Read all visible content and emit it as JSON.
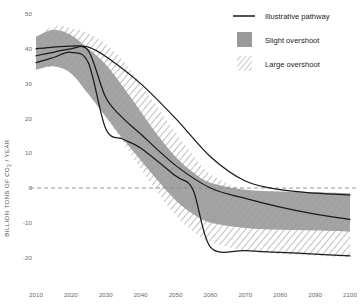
{
  "chart_data": {
    "type": "area",
    "title": "",
    "subtitle": "",
    "xlabel": "",
    "ylabel": "BILLION TONS OF CO₂ / YEAR",
    "ylabel_parts": {
      "pre": "BILLION TONS OF CO",
      "sub": "2",
      "post": " / YEAR"
    },
    "x": [
      2010,
      2020,
      2030,
      2040,
      2050,
      2060,
      2070,
      2080,
      2090,
      2100
    ],
    "xlim": [
      2010,
      2100
    ],
    "ylim": [
      -25,
      52
    ],
    "yticks": [
      50,
      40,
      30,
      20,
      10,
      0,
      -10,
      -20
    ],
    "ytick_labels": [
      "50",
      "40",
      "30",
      "20",
      "10",
      "0",
      "-10",
      "-20"
    ],
    "xticks": [
      2010,
      2020,
      2030,
      2040,
      2050,
      2060,
      2070,
      2080,
      2090,
      2100
    ],
    "xtick_labels": [
      "2010",
      "2020",
      "2030",
      "2040",
      "2050",
      "2060",
      "2070",
      "2080",
      "2090",
      "2100"
    ],
    "grid": false,
    "zero_reference_line": 0,
    "legend_position": "top-right",
    "colors": {
      "slight_overshoot_band": "#9a9a9a",
      "large_overshoot_hatch": "#b4b4b4",
      "pathway_line": "#1a1a1a",
      "zero_line": "#8a8a8a",
      "tick_text": "#6b6b6b",
      "axis_title_text": "#4d4d4d",
      "legend_text": "#1c1c1c",
      "background": "#ffffff"
    },
    "bands": [
      {
        "name": "Slight overshoot",
        "kind": "shaded",
        "x": [
          2010,
          2015,
          2020,
          2025,
          2030,
          2035,
          2040,
          2045,
          2050,
          2055,
          2060,
          2070,
          2080,
          2090,
          2100
        ],
        "upper": [
          43.5,
          45.5,
          44.0,
          40.0,
          35.5,
          29.0,
          22.0,
          15.0,
          9.0,
          4.5,
          1.5,
          -0.5,
          -1.0,
          -1.2,
          -1.5
        ],
        "lower": [
          34.0,
          35.0,
          33.0,
          27.0,
          20.5,
          14.0,
          8.0,
          2.0,
          -3.5,
          -7.5,
          -10.0,
          -11.5,
          -12.0,
          -12.2,
          -12.5
        ]
      },
      {
        "name": "Large overshoot",
        "kind": "hatched",
        "x": [
          2010,
          2015,
          2020,
          2025,
          2030,
          2035,
          2040,
          2045,
          2050,
          2055,
          2060,
          2070,
          2080,
          2090,
          2100
        ],
        "upper": [
          43.5,
          46.5,
          46.0,
          44.5,
          41.5,
          36.5,
          30.0,
          23.0,
          16.0,
          9.5,
          4.0,
          -0.5,
          -1.0,
          -1.2,
          -1.5
        ],
        "lower": [
          34.0,
          35.0,
          33.0,
          27.0,
          20.5,
          13.0,
          5.5,
          -1.5,
          -8.0,
          -12.5,
          -15.5,
          -18.0,
          -19.0,
          -19.5,
          -20.0
        ]
      }
    ],
    "series": [
      {
        "name": "Illustrative pathway 1",
        "x": [
          2010,
          2015,
          2020,
          2025,
          2030,
          2040,
          2050,
          2060,
          2070,
          2080,
          2090,
          2100
        ],
        "values": [
          40.0,
          40.5,
          40.8,
          40.5,
          37.8,
          30.0,
          20.0,
          9.0,
          2.0,
          -0.5,
          -1.5,
          -2.0
        ]
      },
      {
        "name": "Illustrative pathway 2",
        "x": [
          2010,
          2015,
          2020,
          2025,
          2030,
          2035,
          2040,
          2050,
          2060,
          2070,
          2080,
          2090,
          2100
        ],
        "values": [
          38.0,
          39.0,
          40.0,
          39.5,
          26.0,
          20.0,
          15.5,
          6.5,
          0.0,
          -3.0,
          -5.5,
          -7.5,
          -9.0
        ]
      },
      {
        "name": "Illustrative pathway 3",
        "x": [
          2010,
          2015,
          2020,
          2025,
          2030,
          2035,
          2040,
          2050,
          2055,
          2060,
          2070,
          2080,
          2090,
          2100
        ],
        "values": [
          36.0,
          37.5,
          39.0,
          36.0,
          17.0,
          14.0,
          11.5,
          3.5,
          -0.5,
          -17.0,
          -18.0,
          -18.5,
          -19.0,
          -19.5
        ]
      }
    ],
    "legend": [
      {
        "label": "Illustrative pathway",
        "swatch": "line",
        "color": "#1a1a1a"
      },
      {
        "label": "Slight overshoot",
        "swatch": "solid-fill",
        "color": "#9a9a9a"
      },
      {
        "label": "Large overshoot",
        "swatch": "hatched-fill",
        "color": "#b4b4b4"
      }
    ]
  }
}
